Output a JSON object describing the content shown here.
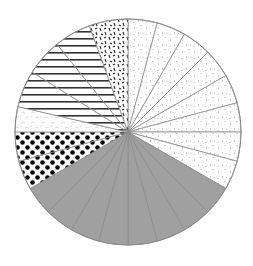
{
  "chart_data": {
    "type": "pie",
    "title": "",
    "start_angle_deg": 0,
    "direction": "clockwise",
    "legend": null,
    "center": [
      128,
      132
    ],
    "radius": 113,
    "slices": [
      {
        "value": 15,
        "pattern": "light-speckle",
        "group": "A"
      },
      {
        "value": 15,
        "pattern": "light-speckle",
        "group": "A"
      },
      {
        "value": 15,
        "pattern": "light-speckle",
        "group": "A"
      },
      {
        "value": 15,
        "pattern": "light-speckle",
        "group": "A"
      },
      {
        "value": 15,
        "pattern": "light-speckle",
        "group": "A"
      },
      {
        "value": 15,
        "pattern": "light-speckle",
        "group": "A"
      },
      {
        "value": 15,
        "pattern": "light-speckle",
        "group": "A"
      },
      {
        "value": 15,
        "pattern": "light-speckle",
        "group": "A"
      },
      {
        "value": 15,
        "pattern": "solid-gray",
        "group": "B"
      },
      {
        "value": 15,
        "pattern": "solid-gray",
        "group": "B"
      },
      {
        "value": 15,
        "pattern": "solid-gray",
        "group": "B"
      },
      {
        "value": 15,
        "pattern": "solid-gray",
        "group": "B"
      },
      {
        "value": 15,
        "pattern": "solid-gray",
        "group": "B"
      },
      {
        "value": 15,
        "pattern": "solid-gray",
        "group": "B"
      },
      {
        "value": 15,
        "pattern": "solid-gray",
        "group": "B"
      },
      {
        "value": 15,
        "pattern": "solid-gray",
        "group": "B"
      },
      {
        "value": 15,
        "pattern": "polka-dots",
        "group": "C"
      },
      {
        "value": 15,
        "pattern": "polka-dots",
        "group": "C"
      },
      {
        "value": 13,
        "pattern": "light-squiggle",
        "group": "D"
      },
      {
        "value": 19,
        "pattern": "horizontal-stripes",
        "group": "E"
      },
      {
        "value": 19,
        "pattern": "horizontal-stripes",
        "group": "E"
      },
      {
        "value": 19,
        "pattern": "horizontal-stripes",
        "group": "E"
      },
      {
        "value": 20,
        "pattern": "black-dashes",
        "group": "F"
      }
    ],
    "colors": {
      "outline": "#8a8a8a",
      "gray_fill": "#a0a0a0",
      "speckle": "#c8c8c8",
      "dots": "#000000",
      "stripes": "#333333",
      "dashes": "#222222"
    }
  }
}
